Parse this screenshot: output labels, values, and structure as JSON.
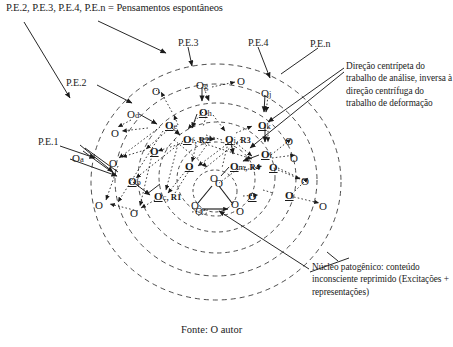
{
  "figure": {
    "legend_top": "P.E.2, P.E.3, P.E.4, P.E.n = Pensamentos espontâneos",
    "source": "Fonte: O autor",
    "note_right": "Direção centrípeta do trabalho de análise, inversa à direção centrífuga do trabalho de deformação",
    "note_bottom": "Núcleo patogênico: conteúdo inconsciente reprimido (Excitações + representações)"
  },
  "pe_labels": [
    {
      "id": "pe1",
      "text": "P.E.1"
    },
    {
      "id": "pe2",
      "text": "P.E.2"
    },
    {
      "id": "pe3",
      "text": "P.E.3"
    },
    {
      "id": "pe4",
      "text": "P.E.4"
    },
    {
      "id": "pen",
      "text": "P.E.n"
    }
  ],
  "named_nodes": [
    {
      "id": "Oa",
      "letter": "O",
      "sub": "a",
      "r": "",
      "bold": false,
      "x": 72,
      "y": 152
    },
    {
      "id": "Ob",
      "letter": "O",
      "sub": "b",
      "r": "",
      "bold": true,
      "x": 128,
      "y": 175
    },
    {
      "id": "Oc",
      "letter": "O",
      "sub": "c",
      "r": ", R1",
      "bold": true,
      "x": 154,
      "y": 190
    },
    {
      "id": "Od",
      "letter": "O",
      "sub": "d",
      "r": "",
      "bold": false,
      "x": 127,
      "y": 108
    },
    {
      "id": "Oe",
      "letter": "O",
      "sub": "e",
      "r": "",
      "bold": true,
      "x": 165,
      "y": 119
    },
    {
      "id": "Of",
      "letter": "O",
      "sub": "f",
      "r": ", R2",
      "bold": true,
      "x": 183,
      "y": 133
    },
    {
      "id": "Og",
      "letter": "O",
      "sub": "g",
      "r": "",
      "bold": false,
      "x": 196,
      "y": 79
    },
    {
      "id": "Oh",
      "letter": "O",
      "sub": "h",
      "r": "",
      "bold": true,
      "x": 199,
      "y": 106
    },
    {
      "id": "Oi",
      "letter": "O",
      "sub": "i",
      "r": ", R3",
      "bold": true,
      "x": 225,
      "y": 133
    },
    {
      "id": "Oj",
      "letter": "O",
      "sub": "j",
      "r": "",
      "bold": false,
      "x": 261,
      "y": 87
    },
    {
      "id": "Ok",
      "letter": "O",
      "sub": "k",
      "r": "",
      "bold": true,
      "x": 258,
      "y": 119
    },
    {
      "id": "Ol",
      "letter": "O",
      "sub": "l",
      "r": "",
      "bold": true,
      "x": 261,
      "y": 148
    },
    {
      "id": "Om",
      "letter": "O",
      "sub": "m",
      "r": ", R4",
      "bold": true,
      "x": 230,
      "y": 160
    }
  ],
  "plain_nodes": [
    {
      "id": "n01",
      "x": 111,
      "y": 127,
      "bold": false
    },
    {
      "id": "n02",
      "x": 109,
      "y": 157,
      "bold": false
    },
    {
      "id": "n03",
      "x": 95,
      "y": 199,
      "bold": false
    },
    {
      "id": "n04",
      "x": 130,
      "y": 207,
      "bold": false
    },
    {
      "id": "n05",
      "x": 150,
      "y": 145,
      "bold": true
    },
    {
      "id": "n06",
      "x": 152,
      "y": 85,
      "bold": false
    },
    {
      "id": "n07",
      "x": 185,
      "y": 160,
      "bold": true
    },
    {
      "id": "n08",
      "x": 237,
      "y": 75,
      "bold": false
    },
    {
      "id": "n09",
      "x": 285,
      "y": 135,
      "bold": false
    },
    {
      "id": "n10",
      "x": 290,
      "y": 152,
      "bold": false
    },
    {
      "id": "n11",
      "x": 269,
      "y": 161,
      "bold": true
    },
    {
      "id": "n12",
      "x": 248,
      "y": 190,
      "bold": true
    },
    {
      "id": "n13",
      "x": 285,
      "y": 189,
      "bold": true
    },
    {
      "id": "n14",
      "x": 301,
      "y": 175,
      "bold": false
    },
    {
      "id": "n15",
      "x": 319,
      "y": 200,
      "bold": false
    },
    {
      "id": "n16",
      "x": 215,
      "y": 177,
      "bold": false
    },
    {
      "id": "n17",
      "x": 195,
      "y": 205,
      "bold": false
    },
    {
      "id": "n18",
      "x": 236,
      "y": 205,
      "bold": false
    }
  ],
  "core": {
    "label": "patogenic-nucleus-triangle",
    "vertices": [
      {
        "x": 215,
        "y": 180
      },
      {
        "x": 196,
        "y": 207
      },
      {
        "x": 236,
        "y": 206
      }
    ]
  },
  "rings": {
    "center_x": 216,
    "center_y": 182,
    "radii": [
      18,
      34,
      52,
      72,
      95,
      118
    ],
    "style": "dashed"
  },
  "colors": {
    "ink": "#1b1b1b",
    "ring": "#3a3a3a",
    "background": "#ffffff"
  }
}
